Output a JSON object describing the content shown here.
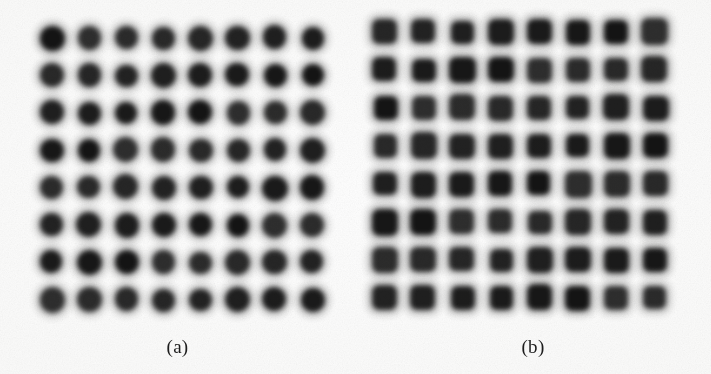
{
  "figure": {
    "background_color": "#fdfdfd",
    "dot_color": "#242424",
    "width": 711,
    "height": 374
  },
  "panels": [
    {
      "id": "a",
      "caption": "(a)",
      "dot_shape": "circle",
      "rows": 8,
      "cols": 8,
      "dot_size": 24,
      "origin_x": 52,
      "origin_y": 38,
      "step_x": 37.2,
      "step_y": 37.4
    },
    {
      "id": "b",
      "caption": "(b)",
      "dot_shape": "rounded-square",
      "rows": 8,
      "cols": 8,
      "dot_size": 25,
      "origin_x": 385,
      "origin_y": 32,
      "step_x": 38.6,
      "step_y": 38.0
    }
  ],
  "chart_data": {
    "type": "heatmap",
    "title": "",
    "xlabel": "",
    "ylabel": "",
    "grid": false,
    "legend": "none",
    "panels": [
      {
        "label": "(a)",
        "marker": "circle",
        "rows": 8,
        "cols": 8,
        "total_dots": 64,
        "values": [
          [
            1,
            1,
            1,
            1,
            1,
            1,
            1,
            1
          ],
          [
            1,
            1,
            1,
            1,
            1,
            1,
            1,
            1
          ],
          [
            1,
            1,
            1,
            1,
            1,
            1,
            1,
            1
          ],
          [
            1,
            1,
            1,
            1,
            1,
            1,
            1,
            1
          ],
          [
            1,
            1,
            1,
            1,
            1,
            1,
            1,
            1
          ],
          [
            1,
            1,
            1,
            1,
            1,
            1,
            1,
            1
          ],
          [
            1,
            1,
            1,
            1,
            1,
            1,
            1,
            1
          ],
          [
            1,
            1,
            1,
            1,
            1,
            1,
            1,
            1
          ]
        ]
      },
      {
        "label": "(b)",
        "marker": "rounded-square",
        "rows": 8,
        "cols": 8,
        "total_dots": 64,
        "values": [
          [
            1,
            1,
            1,
            1,
            1,
            1,
            1,
            1
          ],
          [
            1,
            1,
            1,
            1,
            1,
            1,
            1,
            1
          ],
          [
            1,
            1,
            1,
            1,
            1,
            1,
            1,
            1
          ],
          [
            1,
            1,
            1,
            1,
            1,
            1,
            1,
            1
          ],
          [
            1,
            1,
            1,
            1,
            1,
            1,
            1,
            1
          ],
          [
            1,
            1,
            1,
            1,
            1,
            1,
            1,
            1
          ],
          [
            1,
            1,
            1,
            1,
            1,
            1,
            1,
            1
          ],
          [
            1,
            1,
            1,
            1,
            1,
            1,
            1,
            1
          ]
        ]
      }
    ]
  }
}
